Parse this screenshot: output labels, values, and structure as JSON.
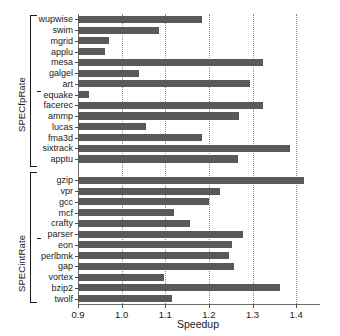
{
  "chart_data": {
    "type": "bar",
    "orientation": "horizontal",
    "title": "",
    "xlabel": "Speedup",
    "ylabel": "",
    "xlim": [
      0.9,
      1.45
    ],
    "xticks": [
      0.9,
      1.0,
      1.1,
      1.2,
      1.3,
      1.4
    ],
    "xticklabels": [
      "0.9",
      "1.0",
      "1.1",
      "1.2",
      "1.3",
      "1.4"
    ],
    "grid": "vertical-dotted",
    "legend": "none",
    "bar_color": "#595959",
    "groups": [
      {
        "name": "SPECfpRate",
        "categories": [
          "wupwise",
          "swim",
          "mgrid",
          "applu",
          "mesa",
          "galgel",
          "art",
          "equake",
          "facerec",
          "ammp",
          "lucas",
          "fma3d",
          "sixtrack",
          "apptu"
        ],
        "values": [
          1.185,
          1.086,
          0.97,
          0.963,
          1.324,
          1.039,
          1.295,
          0.926,
          1.325,
          1.268,
          1.055,
          1.185,
          1.386,
          1.267
        ]
      },
      {
        "name": "SPECintRate",
        "categories": [
          "gzip",
          "vpr",
          "gcc",
          "mcf",
          "crafty",
          "parser",
          "eon",
          "perlbmk",
          "gap",
          "vortex",
          "bzip2",
          "twolf"
        ],
        "values": [
          1.418,
          1.226,
          1.2,
          1.119,
          1.156,
          1.277,
          1.252,
          1.246,
          1.258,
          1.097,
          1.364,
          1.116
        ]
      }
    ]
  }
}
